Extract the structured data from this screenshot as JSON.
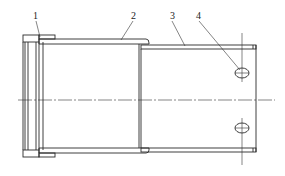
{
  "diagram": {
    "type": "mechanical-section-drawing",
    "callouts": [
      {
        "id": "1",
        "label": "1"
      },
      {
        "id": "2",
        "label": "2"
      },
      {
        "id": "3",
        "label": "3"
      },
      {
        "id": "4",
        "label": "4"
      }
    ],
    "colors": {
      "line": "#2a2a2a",
      "background": "#ffffff"
    }
  }
}
